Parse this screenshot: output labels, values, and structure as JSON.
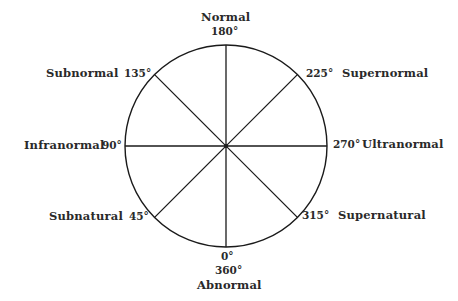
{
  "diagram": {
    "type": "circular-scale",
    "circle": {
      "cx": 226,
      "cy": 146,
      "r": 101,
      "stroke": "#1a1a1a"
    },
    "spokes_degrees": [
      0,
      45,
      90,
      135,
      180,
      225,
      270,
      315
    ],
    "points": {
      "p180": {
        "name": "Normal",
        "degree": "180°"
      },
      "p225": {
        "name": "Supernormal",
        "degree": "225°"
      },
      "p270": {
        "name": "Ultranormal",
        "degree": "270°"
      },
      "p315": {
        "name": "Supernatural",
        "degree": "315°"
      },
      "p0": {
        "name": "Abnormal",
        "degree": "0°",
        "degree_alt": "360°"
      },
      "p45": {
        "name": "Subnatural",
        "degree": "45°"
      },
      "p90": {
        "name": "Infranormal",
        "degree": "90°"
      },
      "p135": {
        "name": "Subnormal",
        "degree": "135°"
      }
    }
  }
}
